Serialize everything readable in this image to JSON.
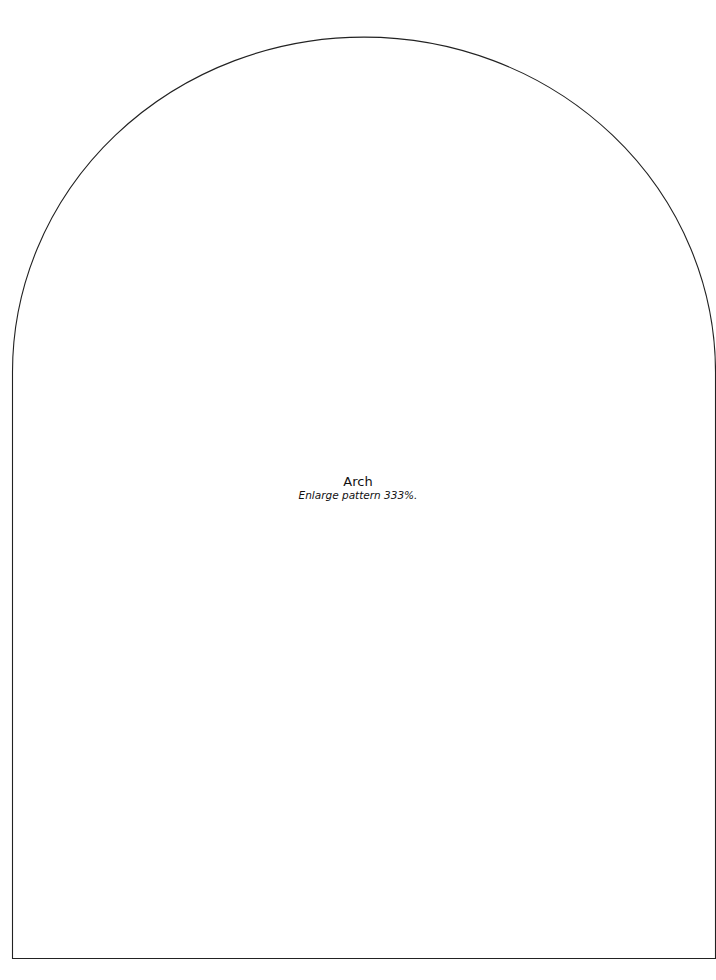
{
  "pattern": {
    "name": "Arch",
    "instruction": "Enlarge pattern 333%.",
    "outline_color": "#222222",
    "background_color": "#ffffff"
  }
}
